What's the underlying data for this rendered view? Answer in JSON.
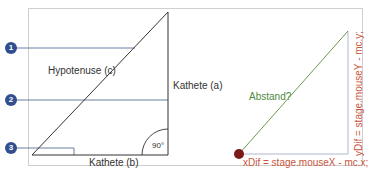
{
  "left_diagram": {
    "markers": [
      {
        "number": "1",
        "target": "hypotenuse"
      },
      {
        "number": "2",
        "target": "kathete-a"
      },
      {
        "number": "3",
        "target": "right-angle-base"
      }
    ],
    "labels": {
      "hypotenuse": "Hypotenuse (c)",
      "kathete_a": "Kathete (a)",
      "kathete_b": "Kathete (b)",
      "angle": "90°"
    }
  },
  "right_diagram": {
    "labels": {
      "distance": "Abstand?",
      "x_formula": "xDif = stage.mouseX - mc.x;",
      "y_formula": "yDif = stage.mouseY - mc.y;"
    }
  },
  "colors": {
    "frame": "#c8c8c8",
    "triangle_stroke": "#333333",
    "marker": "#2f4f8f",
    "marker_line": "#5a6f9a",
    "distance_line": "#6a9a4f",
    "distance_label": "#4f8a3c",
    "formula": "#c8553d",
    "point": "#7a1a1a",
    "leg_stroke": "#b0b8d0"
  }
}
